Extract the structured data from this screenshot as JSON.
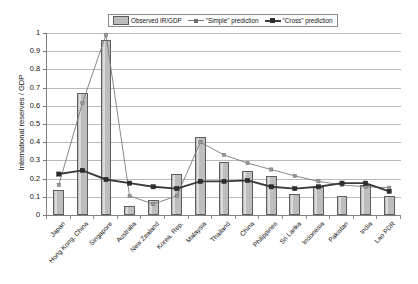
{
  "chart_data": {
    "type": "bar",
    "title": "",
    "xlabel": "",
    "ylabel": "International reserves / GDP",
    "ylim": [
      0,
      1
    ],
    "ytick_step": 0.1,
    "ytick_labels": [
      "1",
      "0.9",
      "0.8",
      "0.7",
      "0.6",
      "0.5",
      "0.4",
      "0.3",
      "0.2",
      "0.1",
      "0"
    ],
    "grid": true,
    "legend_position": "top-center",
    "categories": [
      "Japan",
      "Hong Kong, China",
      "Singapore",
      "Australia",
      "New Zealand",
      "Korea, Rep.",
      "Malaysia",
      "Thailand",
      "China",
      "Philippines",
      "Sri Lanka",
      "Indonesia",
      "Pakistan",
      "India",
      "Lao PDR"
    ],
    "series": [
      {
        "name": "Observed IR/GDP",
        "type": "bar",
        "color": "#bdbdbd",
        "values": [
          0.14,
          0.67,
          0.96,
          0.05,
          0.08,
          0.225,
          0.43,
          0.29,
          0.24,
          0.215,
          0.115,
          0.155,
          0.105,
          0.165,
          0.105
        ]
      },
      {
        "name": "\"Simple\" prediction",
        "type": "line",
        "color": "#7a7a7a",
        "values": [
          0.165,
          0.615,
          0.99,
          0.105,
          0.06,
          0.105,
          0.4,
          0.33,
          0.285,
          0.25,
          0.215,
          0.185,
          0.165,
          0.155,
          0.15
        ]
      },
      {
        "name": "\"Cross\" prediction",
        "type": "line",
        "color": "#3a3a3a",
        "values": [
          0.225,
          0.245,
          0.195,
          0.175,
          0.155,
          0.145,
          0.185,
          0.185,
          0.19,
          0.155,
          0.145,
          0.155,
          0.175,
          0.175,
          0.13
        ]
      }
    ]
  },
  "legend": {
    "items": [
      {
        "label": "Observed IR/GDP",
        "marker": "swatch"
      },
      {
        "label": "\"Simple\" prediction",
        "marker": "line-simple"
      },
      {
        "label": "\"Cross\" prediction",
        "marker": "line-cross"
      }
    ]
  }
}
